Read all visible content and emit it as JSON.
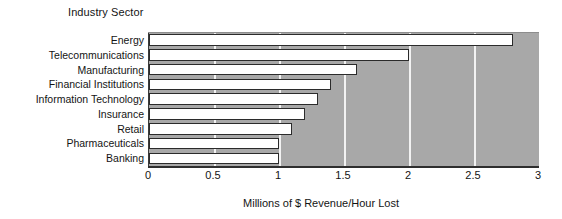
{
  "chart_data": {
    "type": "bar",
    "orientation": "horizontal",
    "title": "",
    "ylabel": "Industry Sector",
    "xlabel": "Millions of $ Revenue/Hour Lost",
    "categories": [
      "Energy",
      "Telecommunications",
      "Manufacturing",
      "Financial Institutions",
      "Information Technology",
      "Insurance",
      "Retail",
      "Pharmaceuticals",
      "Banking"
    ],
    "values": [
      2.8,
      2.0,
      1.6,
      1.4,
      1.3,
      1.2,
      1.1,
      1.0,
      1.0
    ],
    "xlim": [
      0,
      3
    ],
    "xticks": [
      0,
      0.5,
      1,
      1.5,
      2,
      2.5,
      3
    ],
    "xtick_labels": [
      "0",
      "0.5",
      "1",
      "1.5",
      "2",
      "2.5",
      "3"
    ],
    "grid": "vertical-white-gridlines",
    "legend": "none",
    "colors": {
      "bar_fill": "#ffffff",
      "bar_edge": "#2b2b2b",
      "plot_background": "#a8a8a8",
      "gridline": "#f2f2f2",
      "axis": "#2e2e2e",
      "text": "#141414"
    }
  }
}
